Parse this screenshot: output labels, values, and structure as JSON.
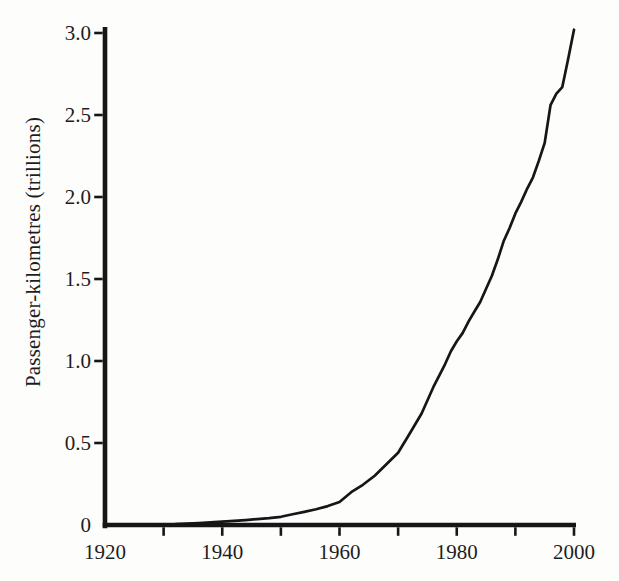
{
  "figure": {
    "background_color": "#fdfdfc",
    "ink_color": "#161616",
    "text_color": "#1d1d1d"
  },
  "chart_data": {
    "type": "line",
    "title": "",
    "xlabel": "",
    "ylabel": "Passenger-kilometres (trillions)",
    "xlim": [
      1920,
      2000
    ],
    "ylim": [
      0,
      3.0
    ],
    "grid": false,
    "legend": "none",
    "x_tick_labels": [
      "1920",
      "1940",
      "1960",
      "1980",
      "2000"
    ],
    "x_tick_label_years": [
      1920,
      1940,
      1960,
      1980,
      2000
    ],
    "x_tick_mark_years": [
      1930,
      1940,
      1950,
      1960,
      1970,
      1980,
      1990,
      2000
    ],
    "y_tick_labels": [
      "0",
      "0.5",
      "1.0",
      "1.5",
      "2.0",
      "2.5",
      "3.0"
    ],
    "y_tick_values": [
      0,
      0.5,
      1.0,
      1.5,
      2.0,
      2.5,
      3.0
    ],
    "series": [
      {
        "name": "world-air-passenger-kilometres",
        "color": "#161616",
        "points": [
          [
            1929,
            0.004
          ],
          [
            1932,
            0.006
          ],
          [
            1936,
            0.012
          ],
          [
            1940,
            0.02
          ],
          [
            1944,
            0.03
          ],
          [
            1948,
            0.042
          ],
          [
            1950,
            0.05
          ],
          [
            1952,
            0.065
          ],
          [
            1954,
            0.08
          ],
          [
            1956,
            0.096
          ],
          [
            1958,
            0.115
          ],
          [
            1960,
            0.14
          ],
          [
            1962,
            0.2
          ],
          [
            1964,
            0.245
          ],
          [
            1966,
            0.3
          ],
          [
            1968,
            0.37
          ],
          [
            1970,
            0.44
          ],
          [
            1972,
            0.56
          ],
          [
            1974,
            0.68
          ],
          [
            1976,
            0.84
          ],
          [
            1978,
            0.98
          ],
          [
            1979,
            1.06
          ],
          [
            1980,
            1.12
          ],
          [
            1981,
            1.17
          ],
          [
            1982,
            1.24
          ],
          [
            1983,
            1.3
          ],
          [
            1984,
            1.36
          ],
          [
            1985,
            1.44
          ],
          [
            1986,
            1.52
          ],
          [
            1987,
            1.62
          ],
          [
            1988,
            1.73
          ],
          [
            1989,
            1.81
          ],
          [
            1990,
            1.9
          ],
          [
            1991,
            1.97
          ],
          [
            1992,
            2.05
          ],
          [
            1993,
            2.12
          ],
          [
            1994,
            2.22
          ],
          [
            1995,
            2.33
          ],
          [
            1996,
            2.56
          ],
          [
            1997,
            2.63
          ],
          [
            1998,
            2.67
          ],
          [
            1999,
            2.84
          ],
          [
            2000,
            3.02
          ]
        ]
      }
    ]
  }
}
